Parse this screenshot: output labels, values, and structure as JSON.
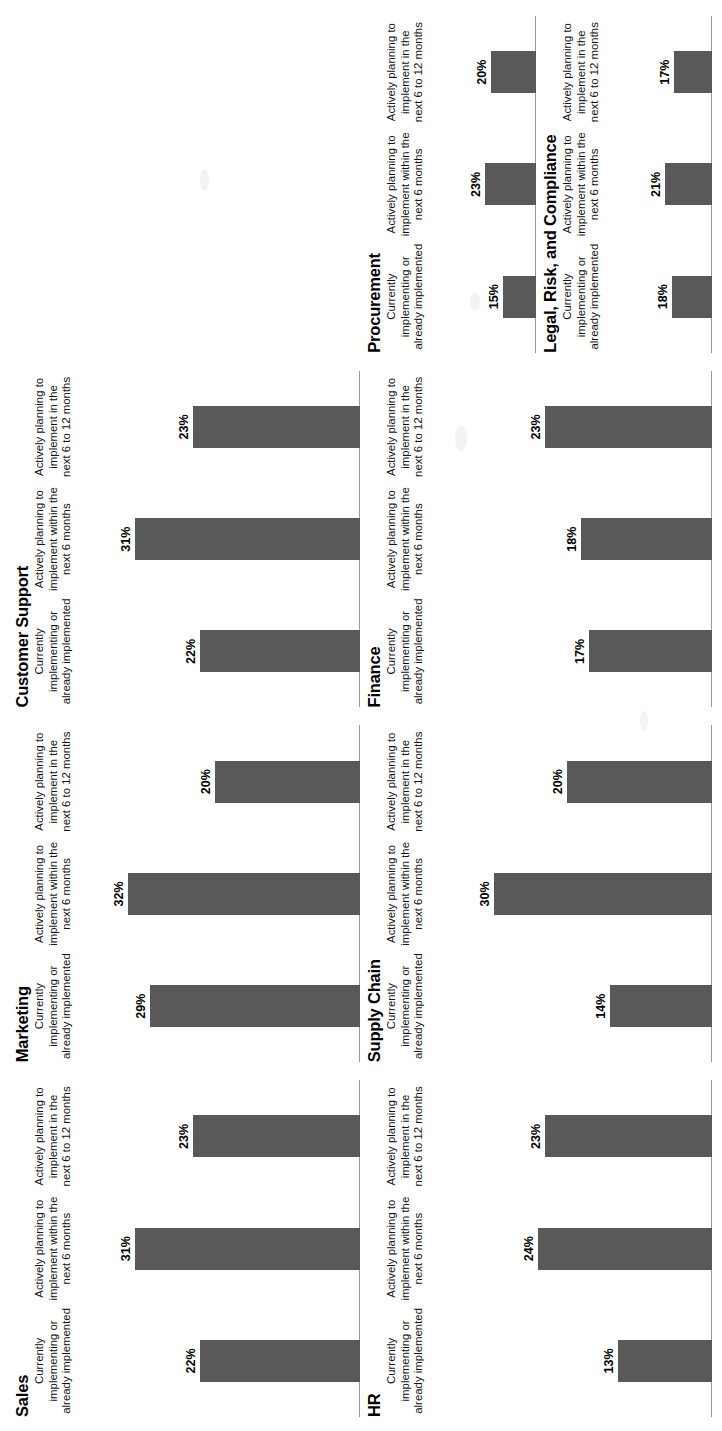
{
  "document": {
    "orientation": "rotated-90-ccw",
    "background_color": "#ffffff",
    "bar_color": "#595959",
    "axis_color": "#9a9a9a"
  },
  "categories": [
    "Currently implementing or already implemented",
    "Actively planning to implement within the next 6 months",
    "Actively planning to implement in the next 6 to 12 months"
  ],
  "panels": [
    {
      "title": "Sales",
      "values": [
        22,
        31,
        23
      ],
      "labels": [
        "22%",
        "31%",
        "23%"
      ]
    },
    {
      "title": "Marketing",
      "values": [
        29,
        32,
        20
      ],
      "labels": [
        "29%",
        "32%",
        "20%"
      ]
    },
    {
      "title": "Customer Support",
      "values": [
        22,
        31,
        23
      ],
      "labels": [
        "22%",
        "31%",
        "23%"
      ]
    },
    {
      "title": "HR",
      "values": [
        13,
        24,
        23
      ],
      "labels": [
        "13%",
        "24%",
        "23%"
      ]
    },
    {
      "title": "Supply Chain",
      "values": [
        14,
        30,
        20
      ],
      "labels": [
        "14%",
        "30%",
        "20%"
      ]
    },
    {
      "title": "Finance",
      "values": [
        17,
        18,
        23
      ],
      "labels": [
        "17%",
        "18%",
        "23%"
      ]
    },
    {
      "title": "Legal, Risk, and Compliance",
      "values": [
        18,
        21,
        17
      ],
      "labels": [
        "18%",
        "21%",
        "17%"
      ]
    },
    {
      "title": "Procurement",
      "values": [
        15,
        23,
        20
      ],
      "labels": [
        "15%",
        "23%",
        "20%"
      ]
    }
  ],
  "chart_data": {
    "type": "bar",
    "title": "",
    "xlabel": "",
    "ylabel": "",
    "ylim": [
      0,
      35
    ],
    "grid": false,
    "legend": "none",
    "categories": [
      "Currently implementing or already implemented",
      "Actively planning to implement within the next 6 months",
      "Actively planning to implement in the next 6 to 12 months"
    ],
    "panels": [
      {
        "name": "Sales",
        "values": [
          22,
          31,
          23
        ]
      },
      {
        "name": "Marketing",
        "values": [
          29,
          32,
          20
        ]
      },
      {
        "name": "Customer Support",
        "values": [
          22,
          31,
          23
        ]
      },
      {
        "name": "HR",
        "values": [
          13,
          24,
          23
        ]
      },
      {
        "name": "Supply Chain",
        "values": [
          14,
          30,
          20
        ]
      },
      {
        "name": "Finance",
        "values": [
          17,
          18,
          23
        ]
      },
      {
        "name": "Legal, Risk, and Compliance",
        "values": [
          18,
          21,
          17
        ]
      },
      {
        "name": "Procurement",
        "values": [
          15,
          23,
          20
        ]
      }
    ],
    "units": "percent",
    "value_labels_shown": true
  }
}
